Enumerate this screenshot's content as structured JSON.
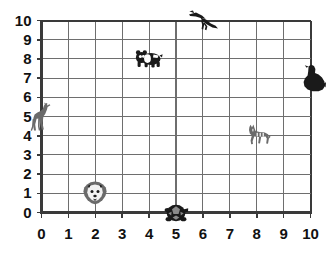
{
  "chart_data": {
    "type": "scatter",
    "title": "",
    "xlabel": "",
    "ylabel": "",
    "xlim": [
      0,
      10
    ],
    "ylim": [
      0,
      10
    ],
    "grid": true,
    "grid_step": 1,
    "legend": "none",
    "x_ticks": [
      "0",
      "1",
      "2",
      "3",
      "4",
      "5",
      "6",
      "7",
      "8",
      "9",
      "10"
    ],
    "y_ticks": [
      "0",
      "1",
      "2",
      "3",
      "4",
      "5",
      "6",
      "7",
      "8",
      "9",
      "10"
    ],
    "points": [
      {
        "label": "giraffe",
        "icon": "giraffe-icon",
        "x": 0,
        "y": 5
      },
      {
        "label": "panda",
        "icon": "panda-icon",
        "x": 4,
        "y": 8
      },
      {
        "label": "bird",
        "icon": "bird-icon",
        "x": 6,
        "y": 10
      },
      {
        "label": "seal",
        "icon": "seal-icon",
        "x": 10,
        "y": 7
      },
      {
        "label": "zebra",
        "icon": "zebra-icon",
        "x": 8,
        "y": 4
      },
      {
        "label": "lion",
        "icon": "lion-icon",
        "x": 2,
        "y": 1
      },
      {
        "label": "turtle",
        "icon": "turtle-icon",
        "x": 5,
        "y": 0
      }
    ]
  },
  "colors": {
    "grid_line": "#6e6e6e",
    "axis_line": "#3a3a3a",
    "marker_dark": "#1a1a1a",
    "marker_gray": "#6b6b6b",
    "text": "#111111",
    "background": "#ffffff"
  }
}
